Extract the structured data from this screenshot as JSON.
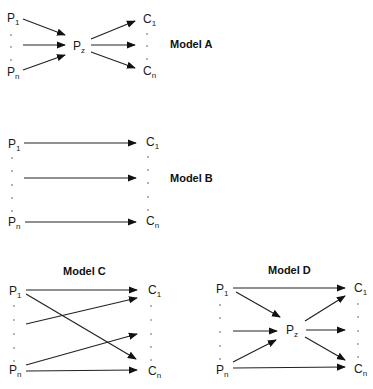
{
  "models": {
    "a": {
      "title": "Model A",
      "source_first": "P",
      "source_first_sub": "1",
      "source_last": "P",
      "source_last_sub": "n",
      "hub": "P",
      "hub_sub": "z",
      "target_first": "C",
      "target_first_sub": "1",
      "target_last": "C",
      "target_last_sub": "n"
    },
    "b": {
      "title": "Model B",
      "source_first": "P",
      "source_first_sub": "1",
      "source_last": "P",
      "source_last_sub": "n",
      "target_first": "C",
      "target_first_sub": "1",
      "target_last": "C",
      "target_last_sub": "n"
    },
    "c": {
      "title": "Model C",
      "source_first": "P",
      "source_first_sub": "1",
      "source_last": "P",
      "source_last_sub": "n",
      "target_first": "C",
      "target_first_sub": "1",
      "target_last": "C",
      "target_last_sub": "n"
    },
    "d": {
      "title": "Model D",
      "source_first": "P",
      "source_first_sub": "1",
      "source_last": "P",
      "source_last_sub": "n",
      "hub": "P",
      "hub_sub": "z",
      "target_first": "C",
      "target_first_sub": "1",
      "target_last": "C",
      "target_last_sub": "n"
    }
  },
  "colors": {
    "stroke": "#222222",
    "text": "#1a1a1a",
    "background": "#ffffff"
  }
}
